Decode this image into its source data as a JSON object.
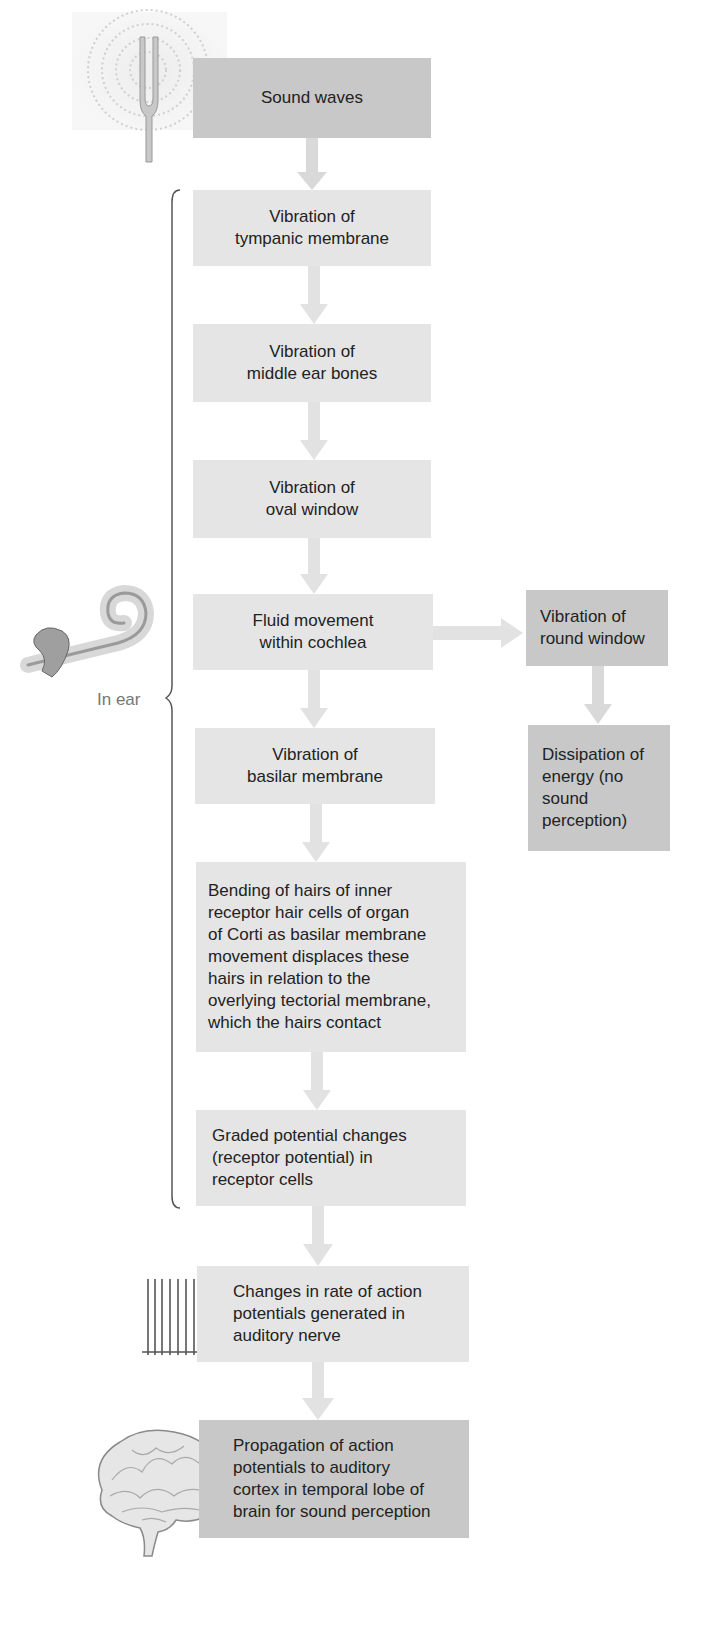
{
  "diagram": {
    "type": "flowchart",
    "colors": {
      "dark_box": "#c8c8c8",
      "light_box": "#e5e5e5",
      "arrow": "#dddddd",
      "text": "#222222",
      "bracket_label": "#777777"
    },
    "nodes": [
      {
        "id": "sound_waves",
        "text": "Sound waves",
        "style": "dark"
      },
      {
        "id": "tympanic",
        "text": "Vibration of\ntympanic membrane",
        "style": "light"
      },
      {
        "id": "middle_ear",
        "text": "Vibration of\nmiddle ear bones",
        "style": "light"
      },
      {
        "id": "oval_window",
        "text": "Vibration of\noval window",
        "style": "light"
      },
      {
        "id": "fluid",
        "text": "Fluid movement\nwithin cochlea",
        "style": "light"
      },
      {
        "id": "round_window",
        "text": "Vibration of\nround window",
        "style": "dark"
      },
      {
        "id": "dissipation",
        "text": "Dissipation of\nenergy (no\nsound\nperception)",
        "style": "dark"
      },
      {
        "id": "basilar",
        "text": "Vibration of\nbasilar membrane",
        "style": "light"
      },
      {
        "id": "bending",
        "text": "Bending of hairs of inner\nreceptor hair cells of organ\nof Corti as basilar membrane\nmovement displaces these\nhairs in relation to the\noverlying tectorial membrane,\nwhich the hairs contact",
        "style": "light"
      },
      {
        "id": "graded",
        "text": "Graded potential changes\n(receptor potential) in\nreceptor cells",
        "style": "light"
      },
      {
        "id": "changes",
        "text": "Changes in rate of action\npotentials generated in\nauditory nerve",
        "style": "light"
      },
      {
        "id": "propagation",
        "text": "Propagation of action\npotentials to auditory\ncortex in temporal lobe of\nbrain for sound perception",
        "style": "dark"
      }
    ],
    "edges": [
      [
        "sound_waves",
        "tympanic"
      ],
      [
        "tympanic",
        "middle_ear"
      ],
      [
        "middle_ear",
        "oval_window"
      ],
      [
        "oval_window",
        "fluid"
      ],
      [
        "fluid",
        "round_window"
      ],
      [
        "round_window",
        "dissipation"
      ],
      [
        "fluid",
        "basilar"
      ],
      [
        "basilar",
        "bending"
      ],
      [
        "bending",
        "graded"
      ],
      [
        "graded",
        "changes"
      ],
      [
        "changes",
        "propagation"
      ]
    ],
    "bracket": {
      "label": "In ear",
      "spans": [
        "tympanic",
        "graded"
      ]
    },
    "illustrations": [
      "tuning-fork",
      "cochlea",
      "action-potential-spikes",
      "brain"
    ]
  }
}
